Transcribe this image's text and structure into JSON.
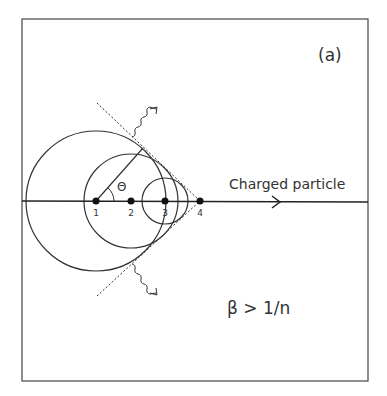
{
  "figure": {
    "panel_label": "(a)",
    "trajectory_label": "Charged particle",
    "angle_label": "Θ",
    "condition_label": "β > 1/n",
    "points": [
      {
        "label": "1",
        "x": 96,
        "r": 70
      },
      {
        "label": "2",
        "x": 131,
        "r": 47
      },
      {
        "label": "3",
        "x": 165,
        "r": 23
      },
      {
        "label": "4",
        "x": 200,
        "r": 0
      }
    ],
    "colors": {
      "stroke": "#333333",
      "background": "#ffffff"
    }
  }
}
